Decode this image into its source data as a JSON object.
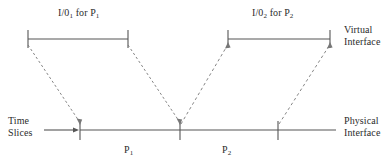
{
  "diagram": {
    "labels": {
      "io1": "I/0",
      "io1_sub": "1",
      "io1_for": " for P",
      "io1_proc_sub": "1",
      "io2": "I/0",
      "io2_sub": "2",
      "io2_for": " for P",
      "io2_proc_sub": "2",
      "virtual_interface_line1": "Virtual",
      "virtual_interface_line2": "Interface",
      "physical_interface_line1": "Physical",
      "physical_interface_line2": "Interface",
      "time_slices_line1": "Time",
      "time_slices_line2": "Slices",
      "p1": "P",
      "p1_sub": "1",
      "p2": "P",
      "p2_sub": "2"
    },
    "colors": {
      "background": "#ffffff",
      "line": "#555555",
      "dashed_line": "#777777",
      "text": "#2b2b2b"
    },
    "geometry": {
      "virtual_line_y": 39,
      "physical_line_y": 130,
      "virtual_segment_1": {
        "x_start": 28,
        "x_end": 128
      },
      "virtual_segment_2": {
        "x_start": 228,
        "x_end": 330
      },
      "physical_line": {
        "x_start": 80,
        "x_end": 336
      },
      "physical_ticks": [
        80,
        180,
        278
      ],
      "tick_half_height": 9,
      "time_slices_arrow": {
        "x_start": 44,
        "x_end": 79,
        "y": 130
      }
    },
    "connectors": [
      {
        "name": "io1-start-to-p1-start",
        "x1": 28,
        "y1": 45,
        "x2": 80,
        "y2": 124,
        "direction": "down"
      },
      {
        "name": "io1-end-to-p1-end",
        "x1": 128,
        "y1": 45,
        "x2": 180,
        "y2": 124,
        "direction": "down"
      },
      {
        "name": "p2-start-to-io2-start",
        "x1": 180,
        "y1": 124,
        "x2": 228,
        "y2": 45,
        "direction": "up"
      },
      {
        "name": "p2-end-to-io2-end",
        "x1": 278,
        "y1": 124,
        "x2": 330,
        "y2": 45,
        "direction": "up"
      }
    ]
  }
}
